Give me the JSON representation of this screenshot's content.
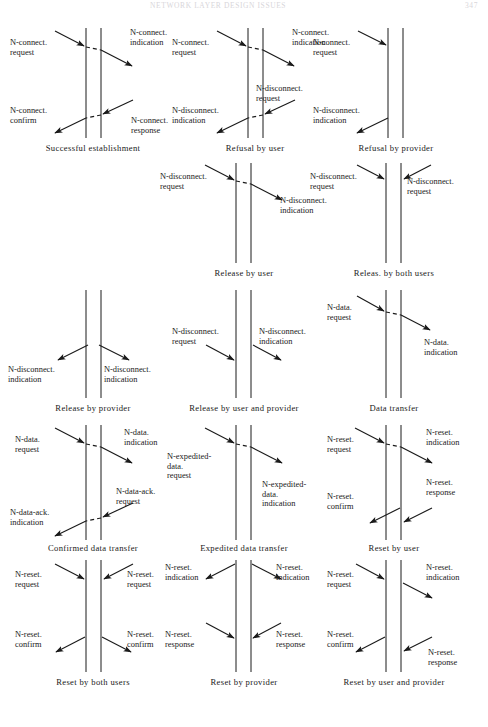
{
  "page": {
    "running_head": "NETWORK LAYER DESIGN ISSUES",
    "page_number": "347",
    "background": "#ffffff",
    "ink": "#1a1a1a"
  },
  "figure": {
    "kind": "time-sequence service-primitive diagrams",
    "columns": 3,
    "rows": 5,
    "legend_note": "Each diagram shows two vertical service-access-point lines (left user / right user) with sloped arrows for primitives and a short dashed segment between the lines where the provider relays the request."
  },
  "diagrams": [
    {
      "id": "successful-establishment",
      "caption": "Successful establishment",
      "row": 1,
      "col": 1,
      "labels": [
        {
          "text": "N-connect.\nrequest",
          "side": "left",
          "position": "upper"
        },
        {
          "text": "N-connect.\nindication",
          "side": "right",
          "position": "upper"
        },
        {
          "text": "N-connect.\nconfirm",
          "side": "left",
          "position": "lower"
        },
        {
          "text": "N-connect.\nresponse",
          "side": "right",
          "position": "lower"
        }
      ],
      "arrows": [
        {
          "from": "left",
          "to": "right",
          "direction": "down-right",
          "dashed_middle": true
        },
        {
          "from": "right",
          "to": "left",
          "direction": "down-left",
          "dashed_middle": true
        }
      ]
    },
    {
      "id": "refusal-by-user",
      "caption": "Refusal by user",
      "row": 1,
      "col": 2,
      "labels": [
        {
          "text": "N-connect.\nrequest",
          "side": "left",
          "position": "upper"
        },
        {
          "text": "N-connect.\nindication",
          "side": "right",
          "position": "upper"
        },
        {
          "text": "N-disconnect.\nrequest",
          "side": "right",
          "position": "middle"
        },
        {
          "text": "N-disconnect.\nindication",
          "side": "left",
          "position": "lower"
        }
      ],
      "arrows": [
        {
          "from": "left",
          "to": "right",
          "direction": "down-right",
          "dashed_middle": true
        },
        {
          "from": "right",
          "to": "left",
          "direction": "down-left",
          "dashed_middle": true
        }
      ]
    },
    {
      "id": "refusal-by-provider",
      "caption": "Refusal by provider",
      "row": 1,
      "col": 3,
      "labels": [
        {
          "text": "N-connect.\nrequest",
          "side": "left",
          "position": "upper"
        },
        {
          "text": "N-disconnect.\nindication",
          "side": "left",
          "position": "lower"
        }
      ],
      "arrows": [
        {
          "from": "left",
          "to": "provider",
          "direction": "down-right",
          "dashed_middle": false
        },
        {
          "from": "provider",
          "to": "left",
          "direction": "down-left",
          "dashed_middle": false
        }
      ]
    },
    {
      "id": "release-by-user",
      "caption": "Release by user",
      "row": 2,
      "col": 2,
      "labels": [
        {
          "text": "N-disconnect.\nrequest",
          "side": "left",
          "position": "upper"
        },
        {
          "text": "N-disconnect.\nindication",
          "side": "right",
          "position": "upper"
        }
      ],
      "arrows": [
        {
          "from": "left",
          "to": "right",
          "direction": "down-right",
          "dashed_middle": true
        }
      ]
    },
    {
      "id": "release-by-both-users",
      "caption": "Releas. by both users",
      "row": 2,
      "col": 3,
      "labels": [
        {
          "text": "N-disconnect.\nrequest",
          "side": "left",
          "position": "upper"
        },
        {
          "text": "N-disconnect.\nrequest",
          "side": "right",
          "position": "upper"
        }
      ],
      "arrows": [
        {
          "from": "left",
          "to": "provider",
          "direction": "down-right",
          "dashed_middle": false
        },
        {
          "from": "right",
          "to": "provider",
          "direction": "down-left",
          "dashed_middle": false
        }
      ]
    },
    {
      "id": "release-by-provider",
      "caption": "Release by provider",
      "row": 3,
      "col": 1,
      "labels": [
        {
          "text": "N-disconnect.\nindication",
          "side": "left",
          "position": "lower"
        },
        {
          "text": "N-disconnect.\nindication",
          "side": "right",
          "position": "lower"
        }
      ],
      "arrows": [
        {
          "from": "provider",
          "to": "left",
          "direction": "down-left",
          "dashed_middle": false
        },
        {
          "from": "provider",
          "to": "right",
          "direction": "down-right",
          "dashed_middle": false
        }
      ]
    },
    {
      "id": "release-by-user-and-provider",
      "caption": "Release by user and provider",
      "row": 3,
      "col": 2,
      "labels": [
        {
          "text": "N-disconnect.\nrequest",
          "side": "left",
          "position": "upper"
        },
        {
          "text": "N-disconnect.\nindication",
          "side": "right",
          "position": "upper"
        }
      ],
      "arrows": [
        {
          "from": "left",
          "to": "provider",
          "direction": "down-right",
          "dashed_middle": false
        },
        {
          "from": "provider",
          "to": "right",
          "direction": "down-right",
          "dashed_middle": false
        }
      ]
    },
    {
      "id": "data-transfer",
      "caption": "Data transfer",
      "row": 3,
      "col": 3,
      "labels": [
        {
          "text": "N-data.\nrequest",
          "side": "left",
          "position": "upper"
        },
        {
          "text": "N-data.\nindication",
          "side": "right",
          "position": "upper"
        }
      ],
      "arrows": [
        {
          "from": "left",
          "to": "right",
          "direction": "down-right",
          "dashed_middle": true
        }
      ]
    },
    {
      "id": "confirmed-data-transfer",
      "caption": "Confirmed data transfer",
      "row": 4,
      "col": 1,
      "labels": [
        {
          "text": "N-data.\nrequest",
          "side": "left",
          "position": "upper"
        },
        {
          "text": "N-data.\nindication",
          "side": "right",
          "position": "upper"
        },
        {
          "text": "N-data-ack.\nrequest",
          "side": "right",
          "position": "lower"
        },
        {
          "text": "N-data-ack.\nindication",
          "side": "left",
          "position": "lower"
        }
      ],
      "arrows": [
        {
          "from": "left",
          "to": "right",
          "direction": "down-right",
          "dashed_middle": true
        },
        {
          "from": "right",
          "to": "left",
          "direction": "down-left",
          "dashed_middle": true
        }
      ]
    },
    {
      "id": "expedited-data-transfer",
      "caption": "Expedited data transfer",
      "row": 4,
      "col": 2,
      "labels": [
        {
          "text": "N-expedited-\ndata.\nrequest",
          "side": "left",
          "position": "upper"
        },
        {
          "text": "N-expedited-\ndata.\nindication",
          "side": "right",
          "position": "upper"
        }
      ],
      "arrows": [
        {
          "from": "left",
          "to": "right",
          "direction": "down-right",
          "dashed_middle": true
        }
      ]
    },
    {
      "id": "reset-by-user",
      "caption": "Reset by user",
      "row": 4,
      "col": 3,
      "labels": [
        {
          "text": "N-reset.\nrequest",
          "side": "left",
          "position": "upper"
        },
        {
          "text": "N-reset.\nindication",
          "side": "right",
          "position": "upper"
        },
        {
          "text": "N-reset.\nconfirm",
          "side": "left",
          "position": "lower"
        },
        {
          "text": "N-reset.\nresponse",
          "side": "right",
          "position": "lower"
        }
      ],
      "arrows": [
        {
          "from": "left",
          "to": "right",
          "direction": "down-right",
          "dashed_middle": true
        },
        {
          "from": "right",
          "to": "left",
          "direction": "down-left",
          "dashed_middle": false
        }
      ]
    },
    {
      "id": "reset-by-both-users",
      "caption": "Reset by both users",
      "row": 5,
      "col": 1,
      "labels": [
        {
          "text": "N-reset.\nrequest",
          "side": "left",
          "position": "upper"
        },
        {
          "text": "N-reset.\nrequest",
          "side": "right",
          "position": "upper"
        },
        {
          "text": "N-reset.\nconfirm",
          "side": "left",
          "position": "lower"
        },
        {
          "text": "N-reset.\nconfirm",
          "side": "right",
          "position": "lower"
        }
      ],
      "arrows": [
        {
          "from": "left",
          "to": "provider",
          "direction": "down-right",
          "dashed_middle": false
        },
        {
          "from": "right",
          "to": "provider",
          "direction": "down-left",
          "dashed_middle": false
        },
        {
          "from": "provider",
          "to": "left",
          "direction": "down-left",
          "dashed_middle": false
        },
        {
          "from": "provider",
          "to": "right",
          "direction": "down-right",
          "dashed_middle": false
        }
      ]
    },
    {
      "id": "reset-by-provider",
      "caption": "Reset by provider",
      "row": 5,
      "col": 2,
      "labels": [
        {
          "text": "N-reset.\nindication",
          "side": "left",
          "position": "upper"
        },
        {
          "text": "N-reset.\nindication",
          "side": "right",
          "position": "upper"
        },
        {
          "text": "N-reset.\nresponse",
          "side": "left",
          "position": "lower"
        },
        {
          "text": "N-reset.\nresponse",
          "side": "right",
          "position": "lower"
        }
      ],
      "arrows": [
        {
          "from": "provider",
          "to": "left",
          "direction": "down-left",
          "dashed_middle": false
        },
        {
          "from": "provider",
          "to": "right",
          "direction": "down-right",
          "dashed_middle": false
        },
        {
          "from": "left",
          "to": "provider",
          "direction": "down-right",
          "dashed_middle": false
        },
        {
          "from": "right",
          "to": "provider",
          "direction": "down-left",
          "dashed_middle": false
        }
      ]
    },
    {
      "id": "reset-by-user-and-provider",
      "caption": "Reset by user and provider",
      "row": 5,
      "col": 3,
      "labels": [
        {
          "text": "N-reset.\nrequest",
          "side": "left",
          "position": "upper"
        },
        {
          "text": "N-reset.\nindication",
          "side": "right",
          "position": "upper"
        },
        {
          "text": "N-reset.\nconfirm",
          "side": "left",
          "position": "lower"
        },
        {
          "text": "N-reset.\nresponse",
          "side": "right",
          "position": "lower"
        }
      ],
      "arrows": [
        {
          "from": "left",
          "to": "provider",
          "direction": "down-right",
          "dashed_middle": false
        },
        {
          "from": "provider",
          "to": "right",
          "direction": "down-right",
          "dashed_middle": false
        },
        {
          "from": "provider",
          "to": "left",
          "direction": "down-left",
          "dashed_middle": false
        },
        {
          "from": "right",
          "to": "provider",
          "direction": "down-left",
          "dashed_middle": false
        }
      ]
    }
  ],
  "labels_flat": {
    "d1_l1": "N-connect.\nrequest",
    "d1_l2": "N-connect.\nindication",
    "d1_l3": "N-connect.\nconfirm",
    "d1_l4": "N-connect.\nresponse",
    "d1_cap": "Successful establishment",
    "d2_l1": "N-connect.\nrequest",
    "d2_l2": "N-connect.\nindication",
    "d2_l3": "N-disconnect.\nrequest",
    "d2_l4": "N-disconnect.\nindication",
    "d2_cap": "Refusal by user",
    "d3_l1": "N-connect.\nrequest",
    "d3_l2": "N-disconnect.\nindication",
    "d3_cap": "Refusal by provider",
    "d4_l1": "N-disconnect.\nrequest",
    "d4_l2": "N-disconnect.\nindication",
    "d4_cap": "Release by user",
    "d5_l1": "N-disconnect.\nrequest",
    "d5_l2": "N-disconnect.\nrequest",
    "d5_cap": "Releas. by both users",
    "d6_l1": "N-disconnect.\nindication",
    "d6_l2": "N-disconnect.\nindication",
    "d6_cap": "Release by provider",
    "d7_l1": "N-disconnect.\nrequest",
    "d7_l2": "N-disconnect.\nindication",
    "d7_cap": "Release by user and provider",
    "d8_l1": "N-data.\nrequest",
    "d8_l2": "N-data.\nindication",
    "d8_cap": "Data transfer",
    "d9_l1": "N-data.\nrequest",
    "d9_l2": "N-data.\nindication",
    "d9_l3": "N-data-ack.\nrequest",
    "d9_l4": "N-data-ack.\nindication",
    "d9_cap": "Confirmed data transfer",
    "d10_l1": "N-expedited-\ndata.\nrequest",
    "d10_l2": "N-expedited-\ndata.\nindication",
    "d10_cap": "Expedited data transfer",
    "d11_l1": "N-reset.\nrequest",
    "d11_l2": "N-reset.\nindication",
    "d11_l3": "N-reset.\nconfirm",
    "d11_l4": "N-reset.\nresponse",
    "d11_cap": "Reset by user",
    "d12_l1": "N-reset.\nrequest",
    "d12_l2": "N-reset.\nrequest",
    "d12_l3": "N-reset.\nconfirm",
    "d12_l4": "N-reset.\nconfirm",
    "d12_cap": "Reset by both users",
    "d13_l1": "N-reset.\nindication",
    "d13_l2": "N-reset.\nindication",
    "d13_l3": "N-reset.\nresponse",
    "d13_l4": "N-reset.\nresponse",
    "d13_cap": "Reset by provider",
    "d14_l1": "N-reset.\nrequest",
    "d14_l2": "N-reset.\nindication",
    "d14_l3": "N-reset.\nconfirm",
    "d14_l4": "N-reset.\nresponse",
    "d14_cap": "Reset by user and provider"
  }
}
